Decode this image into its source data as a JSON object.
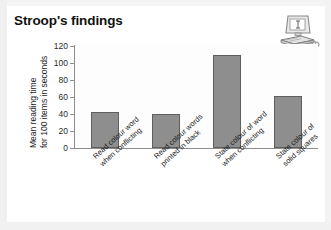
{
  "slide": {
    "title": "Stroop's findings",
    "icon": "computer-icon"
  },
  "chart_data": {
    "type": "bar",
    "title": "Stroop's findings",
    "xlabel": "",
    "ylabel": "Mean reading time for 100 items in seconds",
    "ylabel_line1": "Mean reading time",
    "ylabel_line2": "for 100 items in seconds",
    "ylim": [
      0,
      120
    ],
    "yticks": [
      0,
      20,
      40,
      60,
      80,
      100,
      120
    ],
    "ytick_labels": [
      "0",
      "20",
      "40",
      "60",
      "80",
      "100",
      "120"
    ],
    "grid": false,
    "legend": false,
    "bar_color": "#8e8e8e",
    "bar_edge_color": "#5e5e5e",
    "categories": [
      "Read colour word when conflicting",
      "Read colour words printed in black",
      "State colour of word when conflicting",
      "State colour of solid squares"
    ],
    "category_lines": [
      [
        "Read colour word",
        "when conflicting"
      ],
      [
        "Read colour words",
        "printed in black"
      ],
      [
        "State colour of word",
        "when conflicting"
      ],
      [
        "State colour of",
        "solid squares"
      ]
    ],
    "values": [
      42,
      40,
      110,
      61
    ]
  }
}
